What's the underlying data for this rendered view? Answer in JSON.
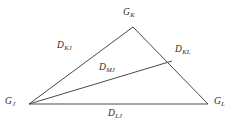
{
  "diagram": {
    "type": "geometry-triangle",
    "background_color": "#ffffff",
    "line_color": "#4a4a4a",
    "text_color": "#2b2b2b",
    "vertices": [
      {
        "id": "G_J",
        "base": "G",
        "subscript": "J",
        "x": 29,
        "y": 104,
        "role": "left-vertex"
      },
      {
        "id": "G_K",
        "base": "G",
        "subscript": "K",
        "x": 133,
        "y": 27,
        "role": "apex-vertex"
      },
      {
        "id": "G_L",
        "base": "G",
        "subscript": "L",
        "x": 208,
        "y": 104,
        "role": "right-vertex"
      },
      {
        "id": "M",
        "base": "M",
        "subscript": "",
        "x": 172,
        "y": 61,
        "role": "interior-point-on-edge"
      }
    ],
    "edges": [
      {
        "id": "D_KJ",
        "base": "D",
        "subscript": "KJ",
        "from": "G_J",
        "to": "G_K",
        "label_x": 57,
        "label_y": 41
      },
      {
        "id": "D_KL",
        "base": "D",
        "subscript": "KL",
        "from": "G_K",
        "to": "G_L",
        "label_x": 175,
        "label_y": 45
      },
      {
        "id": "D_MJ",
        "base": "D",
        "subscript": "MJ",
        "from": "G_J",
        "to": "M",
        "label_x": 99,
        "label_y": 63
      },
      {
        "id": "D_LJ",
        "base": "D",
        "subscript": "LJ",
        "from": "G_J",
        "to": "G_L",
        "label_x": 108,
        "label_y": 109
      }
    ]
  },
  "labels": {
    "vertex_k": {
      "base": "G",
      "sub": "K"
    },
    "vertex_j": {
      "base": "G",
      "sub": "J"
    },
    "vertex_l": {
      "base": "G",
      "sub": "L"
    },
    "edge_kj": {
      "base": "D",
      "sub": "KJ"
    },
    "edge_kl": {
      "base": "D",
      "sub": "KL"
    },
    "edge_mj": {
      "base": "D",
      "sub": "MJ"
    },
    "edge_lj": {
      "base": "D",
      "sub": "LJ"
    }
  }
}
